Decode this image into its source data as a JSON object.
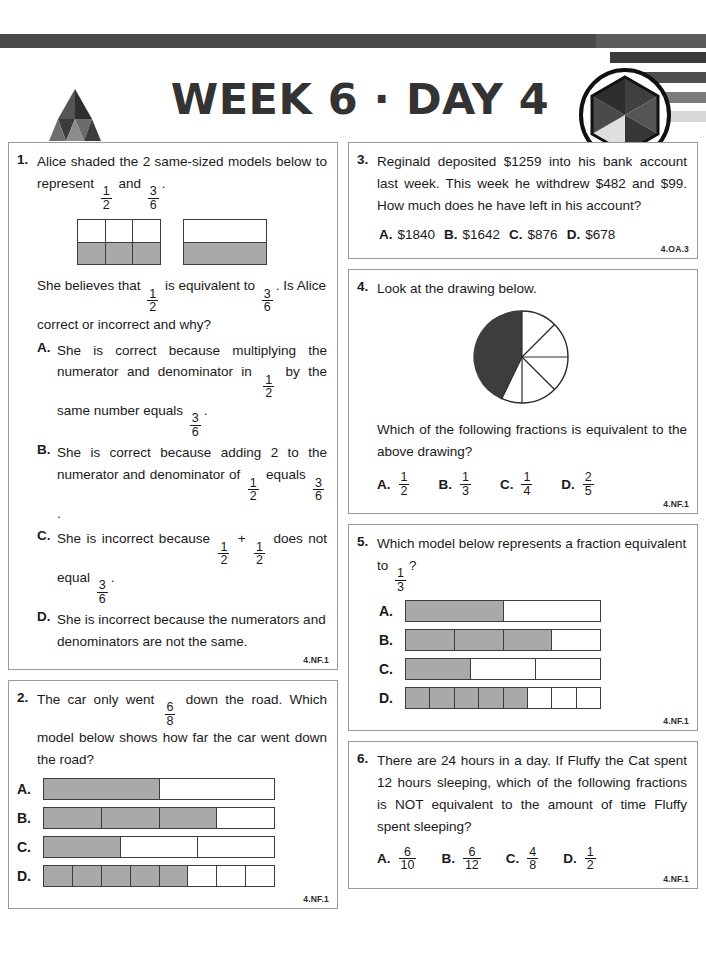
{
  "header": {
    "title": "WEEK 6 · DAY 4",
    "brand": "ARGOPREP.COM",
    "logo_icon": "argoprep-mountain-logo",
    "badge_icon": "hexagon-badge-logo"
  },
  "questions": [
    {
      "number": "1.",
      "standard": "4.NF.1",
      "prompt_parts": [
        "Alice shaded the 2 same-sized models below to represent ",
        "1",
        "2",
        " and ",
        "3",
        "6",
        "."
      ],
      "prompt_line2_parts": [
        "She believes that ",
        "1",
        "2",
        " is equivalent to ",
        "3",
        "6",
        ". Is Alice correct or incorrect and why?"
      ],
      "models": [
        {
          "name": "three-column-half-shaded",
          "cols": 3,
          "rows": 2,
          "shaded_row": "bottom"
        },
        {
          "name": "one-column-half-shaded",
          "cols": 1,
          "rows": 2,
          "shaded_row": "bottom"
        }
      ],
      "choices": [
        {
          "letter": "A.",
          "parts": [
            "She is correct because multiplying the numerator and denominator in ",
            "1",
            "2",
            " by the same number equals ",
            "3",
            "6",
            "."
          ]
        },
        {
          "letter": "B.",
          "parts": [
            "She is correct because adding 2 to the numerator and denominator of ",
            "1",
            "2",
            " equals ",
            "3",
            "6",
            "."
          ]
        },
        {
          "letter": "C.",
          "parts": [
            "She is incorrect because ",
            "1",
            "2",
            " + ",
            "1",
            "2",
            " does not equal ",
            "3",
            "6",
            "."
          ]
        },
        {
          "letter": "D.",
          "text": "She is incorrect because the numerators and denominators are not the same."
        }
      ]
    },
    {
      "number": "2.",
      "standard": "4.NF.1",
      "prompt_pre": "The car only went ",
      "frac_num": "6",
      "frac_den": "8",
      "prompt_post": " down the road. Which model below shows how far the car went down the road?",
      "bars": [
        {
          "letter": "A.",
          "parts": 2,
          "shaded": 1
        },
        {
          "letter": "B.",
          "parts": 4,
          "shaded": 3
        },
        {
          "letter": "C.",
          "parts": 3,
          "shaded": 1
        },
        {
          "letter": "D.",
          "parts": 8,
          "shaded": 5
        }
      ]
    },
    {
      "number": "3.",
      "standard": "4.OA.3",
      "text": "Reginald deposited $1259 into his bank account last week. This week he withdrew $482 and $99. How much does he have left in his account?",
      "choices": [
        {
          "letter": "A.",
          "value": "$1840"
        },
        {
          "letter": "B.",
          "value": "$1642"
        },
        {
          "letter": "C.",
          "value": "$876"
        },
        {
          "letter": "D.",
          "value": "$678"
        }
      ]
    },
    {
      "number": "4.",
      "standard": "4.NF.1",
      "text": "Look at the drawing below.",
      "question2": "Which of the following fractions is equivalent to the above drawing?",
      "pie": {
        "name": "pie-chart-eighths",
        "slices": 8,
        "shaded": 4
      },
      "choices": [
        {
          "letter": "A.",
          "num": "1",
          "den": "2"
        },
        {
          "letter": "B.",
          "num": "1",
          "den": "3"
        },
        {
          "letter": "C.",
          "num": "1",
          "den": "4"
        },
        {
          "letter": "D.",
          "num": "2",
          "den": "5"
        }
      ]
    },
    {
      "number": "5.",
      "standard": "4.NF.1",
      "prompt_pre": "Which model below represents a fraction equivalent to ",
      "frac_num": "1",
      "frac_den": "3",
      "prompt_post": "?",
      "bars": [
        {
          "letter": "A.",
          "parts": 2,
          "shaded": 1
        },
        {
          "letter": "B.",
          "parts": 4,
          "shaded": 3
        },
        {
          "letter": "C.",
          "parts": 3,
          "shaded": 1
        },
        {
          "letter": "D.",
          "parts": 8,
          "shaded": 5
        }
      ]
    },
    {
      "number": "6.",
      "standard": "4.NF.1",
      "text": "There are 24 hours in a day. If Fluffy the Cat spent 12 hours sleeping, which of the following fractions is NOT equivalent to the amount of time Fluffy spent sleeping?",
      "choices": [
        {
          "letter": "A.",
          "num": "6",
          "den": "10"
        },
        {
          "letter": "B.",
          "num": "6",
          "den": "12"
        },
        {
          "letter": "C.",
          "num": "4",
          "den": "8"
        },
        {
          "letter": "D.",
          "num": "1",
          "den": "2"
        }
      ]
    }
  ],
  "colors": {
    "shade": "#a9a9a9",
    "border": "#3d3d3d",
    "bar": "#4a4a4a"
  }
}
